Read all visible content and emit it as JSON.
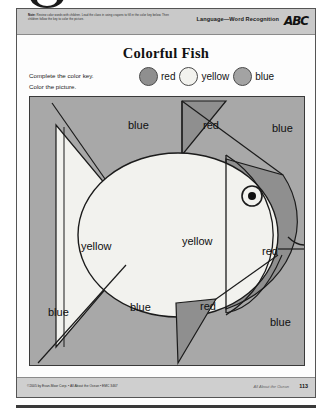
{
  "worksheet": {
    "header": {
      "note_label": "Note:",
      "note_text": "Review color words with children. Lead the class in using crayons to fill in the color key below. Then children follow the key to color the picture.",
      "strand": "Language—Word Recognition",
      "logo_text": "ABC"
    },
    "title": "Colorful Fish",
    "instructions_line1": "Complete the color key.",
    "instructions_line2": "Color the picture.",
    "color_key": [
      {
        "label": "red",
        "swatch_hex": "#8f8f8f"
      },
      {
        "label": "yellow",
        "swatch_hex": "#f2f2ee"
      },
      {
        "label": "blue",
        "swatch_hex": "#a3a3a3"
      }
    ],
    "picture": {
      "background_hex": "#a8a8a8",
      "body_hex": "#f2f2ee",
      "region_labels": [
        {
          "text": "blue",
          "x": 98,
          "y": 32
        },
        {
          "text": "red",
          "x": 173,
          "y": 32
        },
        {
          "text": "blue",
          "x": 242,
          "y": 35
        },
        {
          "text": "yellow",
          "x": 51,
          "y": 153
        },
        {
          "text": "yellow",
          "x": 152,
          "y": 148
        },
        {
          "text": "red",
          "x": 232,
          "y": 158
        },
        {
          "text": "blue",
          "x": 18,
          "y": 219
        },
        {
          "text": "blue",
          "x": 100,
          "y": 214
        },
        {
          "text": "red",
          "x": 170,
          "y": 213
        },
        {
          "text": "blue",
          "x": 240,
          "y": 229
        }
      ]
    },
    "footer": {
      "copyright": "©2005 by Evan-Moor Corp.  •  All About the Ocean  •  EMC 3467",
      "book_title": "All About the Ocean",
      "page_number": "113"
    }
  }
}
